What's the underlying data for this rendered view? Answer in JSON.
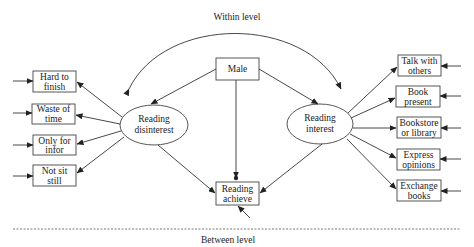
{
  "diagram": {
    "labels": {
      "within_level": "Within level",
      "between_level": "Between level"
    },
    "nodes": {
      "male": {
        "line1": "Male"
      },
      "reading_disinterest": {
        "line1": "Reading",
        "line2": "disinterest"
      },
      "reading_interest": {
        "line1": "Reading",
        "line2": "interest"
      },
      "reading_achieve": {
        "line1": "Reading",
        "line2": "achieve"
      }
    },
    "left_indicators": [
      {
        "line1": "Hard to",
        "line2": "finish"
      },
      {
        "line1": "Waste of",
        "line2": "time"
      },
      {
        "line1": "Only for",
        "line2": "infor"
      },
      {
        "line1": "Not sit",
        "line2": "still"
      }
    ],
    "right_indicators": [
      {
        "line1": "Talk with",
        "line2": "others"
      },
      {
        "line1": "Book",
        "line2": "present"
      },
      {
        "line1": "Bookstore",
        "line2": "or library"
      },
      {
        "line1": "Express",
        "line2": "opinions"
      },
      {
        "line1": "Exchange",
        "line2": "books"
      }
    ],
    "edges": [
      {
        "from": "Male",
        "to": "Reading disinterest"
      },
      {
        "from": "Male",
        "to": "Reading interest"
      },
      {
        "from": "Male",
        "to": "Reading achieve"
      },
      {
        "from": "Reading disinterest",
        "to": "Reading achieve"
      },
      {
        "from": "Reading interest",
        "to": "Reading achieve"
      },
      {
        "from": "Reading disinterest",
        "to": "Reading interest",
        "type": "covariance"
      }
    ]
  }
}
